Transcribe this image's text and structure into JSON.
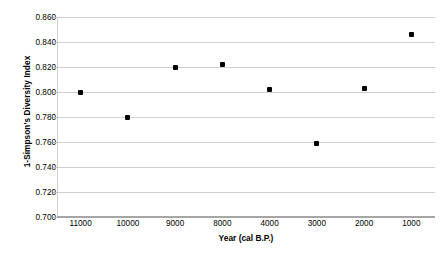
{
  "chart_data": {
    "type": "scatter",
    "title": "",
    "xlabel": "Year (cal B.P.)",
    "ylabel": "1-Simpson's Diversity Index",
    "categories": [
      "11000",
      "10000",
      "9000",
      "8000",
      "4000",
      "3000",
      "2000",
      "1000"
    ],
    "values": [
      0.8,
      0.78,
      0.82,
      0.822,
      0.802,
      0.759,
      0.803,
      0.846
    ],
    "ylim": [
      0.7,
      0.86
    ],
    "ytick_step": 0.02,
    "ytick_labels": [
      "0.860",
      "0.840",
      "0.820",
      "0.800",
      "0.780",
      "0.760",
      "0.740",
      "0.720",
      "0.700"
    ],
    "ytick_values": [
      0.86,
      0.84,
      0.82,
      0.8,
      0.78,
      0.76,
      0.74,
      0.72,
      0.7
    ],
    "grid": "horizontal",
    "legend": "none",
    "marker_color": "#000000",
    "gridline_color": "#cfcfcf",
    "axis_color": "#a6a6a6",
    "series": [
      {
        "name": "1-Simpson's Diversity Index",
        "points": [
          {
            "x": "11000",
            "y": 0.8
          },
          {
            "x": "10000",
            "y": 0.78
          },
          {
            "x": "9000",
            "y": 0.82
          },
          {
            "x": "8000",
            "y": 0.822
          },
          {
            "x": "4000",
            "y": 0.802
          },
          {
            "x": "3000",
            "y": 0.759
          },
          {
            "x": "2000",
            "y": 0.803
          },
          {
            "x": "1000",
            "y": 0.846
          }
        ]
      }
    ]
  }
}
